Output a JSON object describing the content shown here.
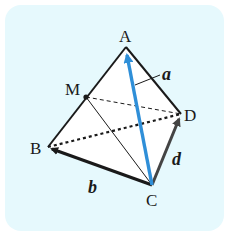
{
  "diagram": {
    "type": "tetrahedron-vectors",
    "background_color": "#e6f9fd",
    "face_color": "#ffffff",
    "edge_color": "#1a1a1a",
    "vector_a_color": "#2f8fd8",
    "vector_d_color": "#444444",
    "vertices": {
      "A": {
        "label": "A",
        "x": 126,
        "y": 47
      },
      "B": {
        "label": "B",
        "x": 48,
        "y": 147
      },
      "C": {
        "label": "C",
        "x": 152,
        "y": 185
      },
      "D": {
        "label": "D",
        "x": 181,
        "y": 114
      },
      "M": {
        "label": "M",
        "x": 86,
        "y": 97
      }
    },
    "vectors": [
      {
        "name": "a",
        "label": "a",
        "from": "C",
        "to": "A"
      },
      {
        "name": "b",
        "label": "b",
        "from": "C",
        "to": "B"
      },
      {
        "name": "d",
        "label": "d",
        "from": "C",
        "to": "D"
      }
    ],
    "edges": [
      {
        "from": "A",
        "to": "B",
        "style": "solid"
      },
      {
        "from": "A",
        "to": "D",
        "style": "solid"
      },
      {
        "from": "M",
        "to": "C",
        "style": "thin"
      },
      {
        "from": "M",
        "to": "D",
        "style": "dashed"
      },
      {
        "from": "B",
        "to": "D",
        "style": "dotted"
      }
    ]
  }
}
